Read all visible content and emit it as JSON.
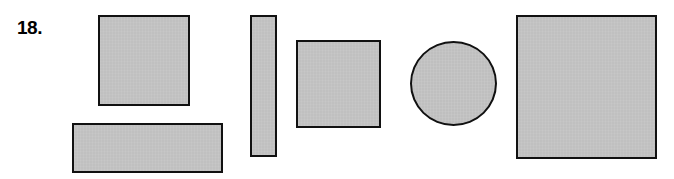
{
  "figure": {
    "item_number": "18.",
    "background_color": "#ffffff",
    "shape_fill_color": "#c4c4c4",
    "shape_stroke_color": "#111111",
    "stroke_width_px": 2,
    "canvas": {
      "width": 674,
      "height": 179
    }
  },
  "shapes": [
    {
      "id": "shape-1",
      "name": "square-upper-left",
      "type": "rectangle",
      "x": 98,
      "y": 15,
      "width": 92,
      "height": 91
    },
    {
      "id": "shape-2",
      "name": "wide-rectangle-lower-left",
      "type": "rectangle",
      "x": 72,
      "y": 123,
      "width": 151,
      "height": 50
    },
    {
      "id": "shape-3",
      "name": "narrow-vertical-bar",
      "type": "rectangle",
      "x": 250,
      "y": 15,
      "width": 27,
      "height": 142
    },
    {
      "id": "shape-4",
      "name": "square-middle",
      "type": "rectangle",
      "x": 296,
      "y": 40,
      "width": 85,
      "height": 88
    },
    {
      "id": "shape-5",
      "name": "ellipse",
      "type": "ellipse",
      "x": 410,
      "y": 41,
      "width": 87,
      "height": 85
    },
    {
      "id": "shape-6",
      "name": "large-square-right",
      "type": "rectangle",
      "x": 516,
      "y": 15,
      "width": 141,
      "height": 144
    }
  ]
}
